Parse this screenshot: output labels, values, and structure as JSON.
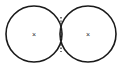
{
  "figure": {
    "title": "Two tangent circles with marked centers",
    "type": "geometric-diagram",
    "background_color": "#ffffff",
    "stroke_color": "#1a1a1a",
    "divider_color": "#3a3a3a",
    "mark_color": "#2a2a2a",
    "canvas": {
      "width": 122,
      "height": 69
    },
    "shapes": [
      {
        "name": "left-circle",
        "kind": "circle",
        "center_x": 34,
        "center_y": 34,
        "radius": 28,
        "fill": "none",
        "stroke_width": 1.6
      },
      {
        "name": "right-circle",
        "kind": "circle",
        "center_x": 88,
        "center_y": 34,
        "radius": 28,
        "fill": "none",
        "stroke_width": 1.6
      }
    ],
    "divider": {
      "name": "shared-boundary",
      "kind": "dotted-vertical-line",
      "x": 61,
      "y_top": 17,
      "y_bottom": 52,
      "dash_pattern": "1.4 2.0",
      "stroke_width": 1.4
    },
    "center_marks": [
      {
        "name": "left-center-mark",
        "label": "×",
        "x": 34,
        "y": 34,
        "font_size": 7
      },
      {
        "name": "right-center-mark",
        "label": "×",
        "x": 88,
        "y": 34,
        "font_size": 7
      }
    ]
  }
}
